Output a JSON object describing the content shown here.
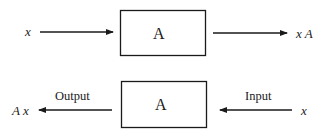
{
  "top_row": {
    "input_var": "x",
    "box_label": "A",
    "output_expr": "x A"
  },
  "bottom_row": {
    "output_expr": "A x",
    "output_label": "Output",
    "box_label": "A",
    "input_label": "Input",
    "input_var": "x"
  }
}
